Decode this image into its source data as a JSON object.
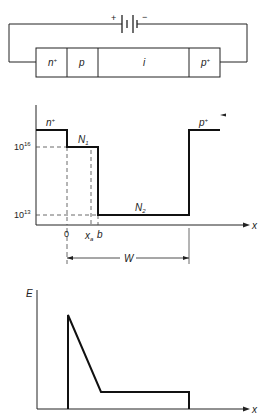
{
  "circuit": {
    "battery": {
      "plus": "+",
      "minus": "−"
    },
    "regions": [
      {
        "label": "n",
        "sup": "+"
      },
      {
        "label": "p",
        "sup": ""
      },
      {
        "label": "i",
        "sup": ""
      },
      {
        "label": "p",
        "sup": "+"
      }
    ]
  },
  "doping_profile": {
    "region_left": {
      "label": "n",
      "sup": "+"
    },
    "region_right": {
      "label": "p",
      "sup": "+"
    },
    "level_high": {
      "base": "10",
      "exp": "16"
    },
    "level_low": {
      "base": "10",
      "exp": "13"
    },
    "n1_label": {
      "base": "N",
      "sub": "1"
    },
    "n2_label": {
      "base": "N",
      "sub": "2"
    },
    "x_ticks": {
      "zero": "0",
      "xa": "x",
      "xa_sub": "a",
      "b": "b"
    },
    "width_label": "W",
    "x_axis_label": "x"
  },
  "field_profile": {
    "y_axis_label": "E",
    "x_axis_label": "x"
  }
}
